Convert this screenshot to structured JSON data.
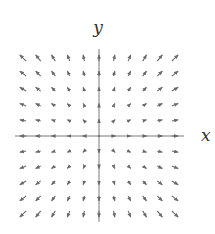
{
  "figure": {
    "type": "vector_field",
    "field": "F(x, y) = (x, y)",
    "x_label": "x",
    "y_label": "y",
    "grid": {
      "min": -5,
      "max": 5,
      "step": 1
    },
    "origin_px": [
      99,
      136
    ],
    "spacing_px": [
      15.2,
      15.6
    ],
    "arrow_scale": 0.42,
    "arrow_color": "#6a6a6a",
    "axis_color": "#7a7a7a",
    "axis_extent_px": {
      "x": [
        15,
        184
      ],
      "y": [
        49,
        222
      ]
    },
    "x_label_pos": [
      201,
      141
    ],
    "y_label_pos": [
      98,
      33
    ]
  }
}
